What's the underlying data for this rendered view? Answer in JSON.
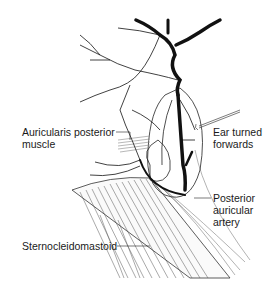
{
  "figure": {
    "labels": {
      "auricularis": {
        "line1": "Auricularis posterior",
        "line2": "muscle"
      },
      "ear": {
        "line1": "Ear turned",
        "line2": "forwards"
      },
      "artery": {
        "line1": "Posterior",
        "line2": "auricular",
        "line3": "artery"
      },
      "scm": {
        "line1": "Sternocleidomastoid"
      }
    },
    "colors": {
      "ink": "#111111",
      "background": "#ffffff",
      "hatch": "#555555"
    }
  }
}
